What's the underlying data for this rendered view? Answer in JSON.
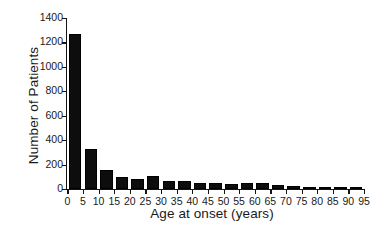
{
  "chart_data": {
    "type": "bar",
    "title": "",
    "subtitle": "",
    "xlabel": "Age at onset (years)",
    "ylabel": "Number of Patients",
    "categories": [
      "0-5",
      "5-10",
      "10-15",
      "15-20",
      "20-25",
      "25-30",
      "30-35",
      "35-40",
      "40-45",
      "45-50",
      "50-55",
      "55-60",
      "60-65",
      "65-70",
      "70-75",
      "75-80",
      "80-85",
      "85-90",
      "90-95"
    ],
    "bin_starts": [
      0,
      5,
      10,
      15,
      20,
      25,
      30,
      35,
      40,
      45,
      50,
      55,
      60,
      65,
      70,
      75,
      80,
      85,
      90
    ],
    "bin_width": 5,
    "values": [
      1270,
      330,
      158,
      100,
      78,
      110,
      68,
      62,
      52,
      46,
      44,
      48,
      46,
      32,
      22,
      15,
      12,
      7,
      2
    ],
    "xlim": [
      0,
      95
    ],
    "ylim": [
      0,
      1400
    ],
    "xticks": [
      "0",
      "5",
      "10",
      "15",
      "20",
      "25",
      "30",
      "35",
      "40",
      "45",
      "50",
      "55",
      "60",
      "65",
      "70",
      "75",
      "80",
      "85",
      "90",
      "95"
    ],
    "xtick_values": [
      0,
      5,
      10,
      15,
      20,
      25,
      30,
      35,
      40,
      45,
      50,
      55,
      60,
      65,
      70,
      75,
      80,
      85,
      90,
      95
    ],
    "yticks": [
      "0",
      "200",
      "400",
      "600",
      "800",
      "1000",
      "1200",
      "1400"
    ],
    "ytick_values": [
      0,
      200,
      400,
      600,
      800,
      1000,
      1200,
      1400
    ],
    "grid": false,
    "legend": null,
    "bar_color": "#0d0d0d",
    "axis_color": "#141414",
    "background": "#ffffff"
  }
}
